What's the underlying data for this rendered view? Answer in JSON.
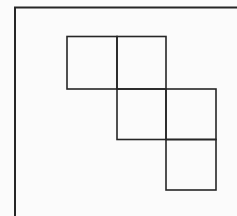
{
  "diagram": {
    "background": "#fbfbfb",
    "stroke_color": "#262626",
    "frame": {
      "top_line": {
        "x1": 14,
        "y1": 7.5,
        "x2": 237,
        "y2": 7.5,
        "stroke_width": 2
      },
      "left_line": {
        "x1": 15,
        "y1": 7,
        "x2": 15,
        "y2": 216,
        "stroke_width": 2
      }
    },
    "squares": [
      {
        "id": "square-row1-col1",
        "x": 67,
        "y": 36.5,
        "width": 50,
        "height": 52.5
      },
      {
        "id": "square-row1-col2",
        "x": 117,
        "y": 36.5,
        "width": 49,
        "height": 52.5
      },
      {
        "id": "square-row2-col2",
        "x": 117,
        "y": 89,
        "width": 49,
        "height": 50.5
      },
      {
        "id": "square-row2-col3",
        "x": 166,
        "y": 89,
        "width": 50,
        "height": 50.5
      },
      {
        "id": "square-row3-col3",
        "x": 166,
        "y": 139.5,
        "width": 50,
        "height": 50.5
      }
    ],
    "square_stroke_width": 1.6
  }
}
